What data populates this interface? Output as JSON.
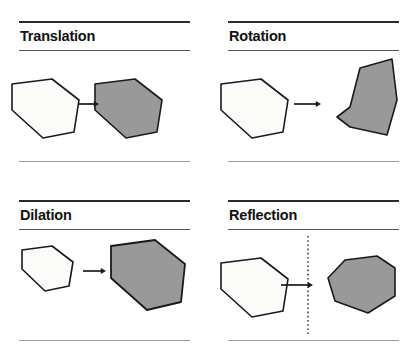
{
  "document": {
    "kind": "geometry-transformations-figure",
    "page_background": "#ffffff"
  },
  "style": {
    "outline_color": "#1a1a1a",
    "preimage_fill": "#fbfbf9",
    "image_fill": "#999999",
    "arrow_color": "#1a1a1a",
    "mirror_line_color": "#3a3a3a",
    "rule_top_color": "#2b2b2b",
    "rule_under_color": "#555555",
    "rule_bottom_color": "#9a9a9a"
  },
  "panels": [
    {
      "id": "translation",
      "title": "Translation",
      "preimage": {
        "label": "preimage-pentagon",
        "fill": "#fbfbf9",
        "points": "12,29 52,24 79,45 74,77 43,83 12,55"
      },
      "image": {
        "label": "image-pentagon",
        "fill": "#999999",
        "points": "95,29 135,24 162,45 157,77 126,83 95,55"
      },
      "arrow": {
        "label": "transformation-arrow",
        "x1": 78,
        "y1": 49,
        "x2": 99,
        "y2": 49
      },
      "mirror_line": null
    },
    {
      "id": "rotation",
      "title": "Rotation",
      "preimage": {
        "label": "preimage-pentagon",
        "fill": "#fbfbf9",
        "points": "12,29 52,24 79,45 74,77 43,83 12,55"
      },
      "image": {
        "label": "image-pentagon",
        "fill": "#999999",
        "points": "141,52 151,13 183,4 188,45 178,80 141,72 128,62"
      },
      "arrow": {
        "label": "transformation-arrow",
        "x1": 85,
        "y1": 49,
        "x2": 112,
        "y2": 49
      },
      "mirror_line": null
    },
    {
      "id": "dilation",
      "title": "Dilation",
      "preimage": {
        "label": "preimage-pentagon",
        "fill": "#fbfbf9",
        "points": "22,16 52,12 73,28 69,52 45,57 22,35"
      },
      "image": {
        "label": "image-pentagon",
        "fill": "#999999",
        "points": "111,12 155,6 185,30 181,68 147,76 111,44"
      },
      "arrow": {
        "label": "transformation-arrow",
        "x1": 83,
        "y1": 37,
        "x2": 106,
        "y2": 37
      },
      "mirror_line": null
    },
    {
      "id": "reflection",
      "title": "Reflection",
      "preimage": {
        "label": "preimage-pentagon",
        "fill": "#fbfbf9",
        "points": "12,29 52,24 79,45 74,77 43,83 12,55"
      },
      "image": {
        "label": "image-pentagon",
        "fill": "#999999",
        "points": "119,44 136,26 168,22 186,34 186,62 159,79 126,67"
      },
      "arrow": {
        "label": "transformation-arrow",
        "x1": 72,
        "y1": 51,
        "x2": 104,
        "y2": 51
      },
      "mirror_line": {
        "label": "line-of-reflection",
        "x": 99,
        "y1": 2,
        "y2": 100
      }
    }
  ]
}
